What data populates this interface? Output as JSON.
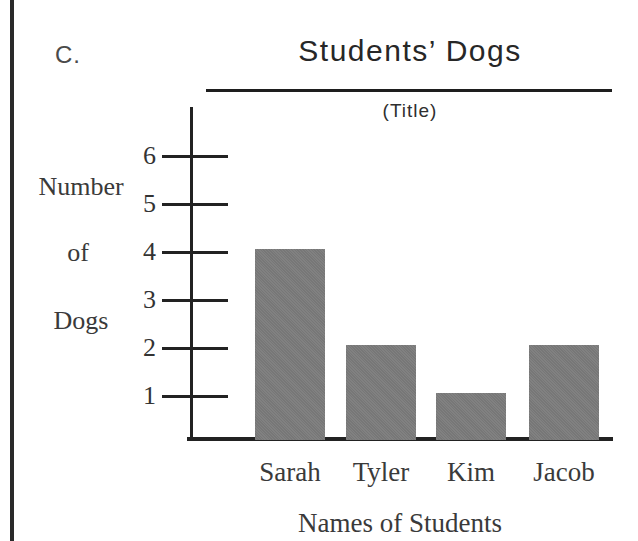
{
  "page": {
    "section_label": "C."
  },
  "chart_data": {
    "type": "bar",
    "title": "Students’ Dogs",
    "subtitle": "(Title)",
    "xlabel": "Names of Students",
    "ylabel": "Number of Dogs",
    "ylabel_lines": [
      "Number",
      "of",
      "Dogs"
    ],
    "categories": [
      "Sarah",
      "Tyler",
      "Kim",
      "Jacob"
    ],
    "values": [
      4,
      2,
      1,
      2
    ],
    "yticks": [
      1,
      2,
      3,
      4,
      5,
      6
    ],
    "ylim": [
      0,
      7
    ],
    "grid": false,
    "legend": false,
    "bar_color": "#7d7d7d",
    "axis_color": "#222222"
  }
}
